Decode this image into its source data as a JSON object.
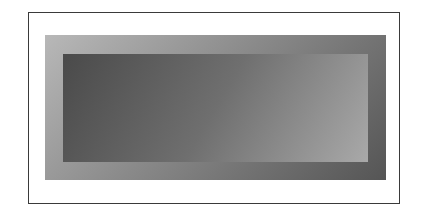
{
  "figure": {
    "colors": {
      "frame_border": "#3a3a3a",
      "background": "#ffffff",
      "outer_gradient_start": "#b8b8b8",
      "outer_gradient_end": "#555555",
      "inner_gradient_start": "#4a4a4a",
      "inner_gradient_end": "#a9a9a9"
    }
  }
}
